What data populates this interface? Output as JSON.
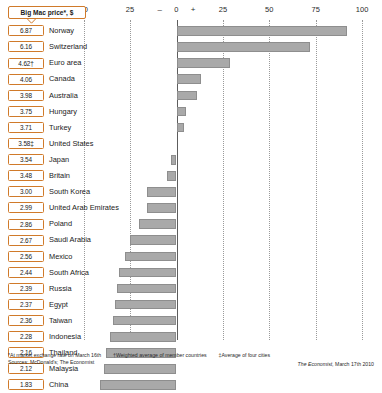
{
  "header": {
    "callout_label": "Big Mac price*, $"
  },
  "axis": {
    "ticks": [
      {
        "label": "50",
        "value": -50
      },
      {
        "label": "25",
        "value": -25
      },
      {
        "label": "–",
        "value": -9,
        "sign": true
      },
      {
        "label": "0",
        "value": 0
      },
      {
        "label": "+",
        "value": 9,
        "sign": true
      },
      {
        "label": "25",
        "value": 25
      },
      {
        "label": "50",
        "value": 50
      },
      {
        "label": "75",
        "value": 75
      },
      {
        "label": "100",
        "value": 100
      }
    ],
    "gridlines": [
      -50,
      -25,
      0,
      25,
      50,
      75,
      100
    ]
  },
  "footnotes": {
    "line1_a": "*At market exchange rate on March 16th",
    "line1_b": "†Weighted average of member countries",
    "line1_c": "‡Average of four cities",
    "line2": "Sources: McDonald's; The Economist",
    "credit_italic": "The Economist,",
    "credit_rest": " March 17th 2010"
  },
  "chart_data": {
    "type": "bar",
    "title": "Big Mac price*, $",
    "xlabel": "Under(–)/over(+) valuation against the dollar, %",
    "ylabel": "",
    "xlim": [
      -50,
      100
    ],
    "grid": true,
    "legend": "none",
    "orientation": "horizontal",
    "categories": [
      "Norway",
      "Switzerland",
      "Euro area",
      "Canada",
      "Australia",
      "Hungary",
      "Turkey",
      "United States",
      "Japan",
      "Britain",
      "South Korea",
      "United Arab Emirates",
      "Poland",
      "Saudi Arabia",
      "Mexico",
      "South Africa",
      "Russia",
      "Egypt",
      "Taiwan",
      "Indonesia",
      "Thailand",
      "Malaysia",
      "China"
    ],
    "series": [
      {
        "name": "Under(–)/over(+) valuation against the dollar, %",
        "values": [
          92,
          72,
          29,
          13,
          11,
          5,
          4,
          0,
          -3,
          -5,
          -16,
          -16,
          -20,
          -25,
          -28,
          -31,
          -32,
          -33,
          -34,
          -36,
          -38,
          -39,
          -41
        ]
      }
    ],
    "rows": [
      {
        "price": "6.87",
        "country": "Norway",
        "value": 92
      },
      {
        "price": "6.16",
        "country": "Switzerland",
        "value": 72
      },
      {
        "price": "4.62†",
        "country": "Euro area",
        "value": 29
      },
      {
        "price": "4.06",
        "country": "Canada",
        "value": 13
      },
      {
        "price": "3.98",
        "country": "Australia",
        "value": 11
      },
      {
        "price": "3.75",
        "country": "Hungary",
        "value": 5
      },
      {
        "price": "3.71",
        "country": "Turkey",
        "value": 4
      },
      {
        "price": "3.58‡",
        "country": "United States",
        "value": 0
      },
      {
        "price": "3.54",
        "country": "Japan",
        "value": -3
      },
      {
        "price": "3.48",
        "country": "Britain",
        "value": -5
      },
      {
        "price": "3.00",
        "country": "South Korea",
        "value": -16
      },
      {
        "price": "2.99",
        "country": "United Arab Emirates",
        "value": -16
      },
      {
        "price": "2.86",
        "country": "Poland",
        "value": -20
      },
      {
        "price": "2.67",
        "country": "Saudi Arabia",
        "value": -25
      },
      {
        "price": "2.56",
        "country": "Mexico",
        "value": -28
      },
      {
        "price": "2.44",
        "country": "South Africa",
        "value": -31
      },
      {
        "price": "2.39",
        "country": "Russia",
        "value": -32
      },
      {
        "price": "2.37",
        "country": "Egypt",
        "value": -33
      },
      {
        "price": "2.36",
        "country": "Taiwan",
        "value": -34
      },
      {
        "price": "2.28",
        "country": "Indonesia",
        "value": -36
      },
      {
        "price": "2.16",
        "country": "Thailand",
        "value": -38
      },
      {
        "price": "2.12",
        "country": "Malaysia",
        "value": -39
      },
      {
        "price": "1.83",
        "country": "China",
        "value": -41
      }
    ]
  },
  "colors": {
    "bar": "#a9a9a9",
    "box_border": "#d07a2a",
    "axis": "#5d5d5d",
    "grid": "#9a9a9a"
  }
}
